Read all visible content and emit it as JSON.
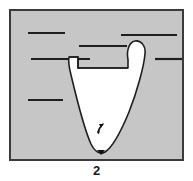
{
  "figure": {
    "caption": "2",
    "label_semantic": "figure-number",
    "panel": {
      "frame": {
        "x": 9,
        "y": 9,
        "width": 175,
        "height": 152,
        "border_color": "#3b3b3b",
        "border_width": 2,
        "fill_color": "#c6c6c6"
      }
    },
    "background_lines": [
      {
        "name": "stratum-line-upper-left",
        "x1": 28,
        "y1": 33,
        "x2": 65,
        "y2": 33
      },
      {
        "name": "stratum-line-upper-right",
        "x1": 121,
        "y1": 35,
        "x2": 177,
        "y2": 35
      },
      {
        "name": "stratum-line-mid-center",
        "x1": 79,
        "y1": 46,
        "x2": 127,
        "y2": 46
      },
      {
        "name": "stratum-line-mid-left",
        "x1": 31,
        "y1": 59,
        "x2": 90,
        "y2": 59
      },
      {
        "name": "stratum-line-mid-right",
        "x1": 155,
        "y1": 59,
        "x2": 184,
        "y2": 59
      },
      {
        "name": "stratum-line-lower-left",
        "x1": 28,
        "y1": 100,
        "x2": 63,
        "y2": 100
      }
    ],
    "line_style": {
      "color": "#1f1f1f",
      "width": 2.2
    },
    "white_region": {
      "name": "funnel-cavity",
      "fill_color": "#ffffff",
      "outline_color": "#1f1f1f",
      "outline_width": 1.6,
      "description": "V-shaped funnel cavity with rounded bottom and a curved lobe at the upper right, notched step at the upper left"
    },
    "marker": {
      "name": "flow-arrow-marker",
      "x": 100,
      "y": 127,
      "color": "#111111",
      "description": "small dark arrow-shaped marker inside the lower part of the cavity"
    },
    "bottom_tick": {
      "name": "base-point-marker",
      "x": 101,
      "y": 153,
      "color": "#111111"
    }
  }
}
